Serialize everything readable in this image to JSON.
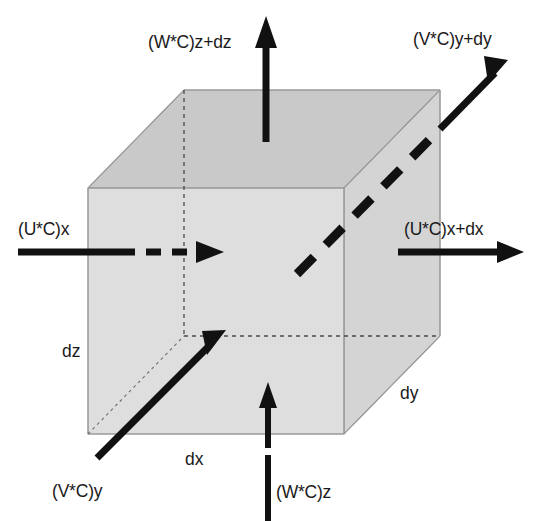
{
  "figure": {
    "background_color": "#ffffff",
    "ink_color": "#111111",
    "cube": {
      "front_face_color": "#dcdcdc",
      "top_face_color": "#c9c9c9",
      "side_face_color": "#d2d2d2",
      "edge_color": "#9a9a9a"
    }
  },
  "labels": {
    "top_flux": "(W*C)z+dz",
    "top_right_flux": "(V*C)y+dy",
    "left_flux": "(U*C)x",
    "right_flux": "(U*C)x+dx",
    "bottom_left_flux": "(V*C)y",
    "bottom_flux": "(W*C)z",
    "dim_dz": "dz",
    "dim_dx": "dx",
    "dim_dy": "dy"
  },
  "arrows": [
    {
      "name": "w-c-z-plus-dz",
      "label": "(W*C)z+dz",
      "direction": "up",
      "style": "solid",
      "axis": "z",
      "face": "top"
    },
    {
      "name": "v-c-y-plus-dy",
      "label": "(V*C)y+dy",
      "direction": "up-right",
      "style": "dashed-to-solid",
      "axis": "y",
      "face": "back-right"
    },
    {
      "name": "u-c-x",
      "label": "(U*C)x",
      "direction": "right",
      "style": "solid-to-dashed",
      "axis": "x",
      "face": "left"
    },
    {
      "name": "u-c-x-plus-dx",
      "label": "(U*C)x+dx",
      "direction": "right",
      "style": "solid",
      "axis": "x",
      "face": "right"
    },
    {
      "name": "v-c-y",
      "label": "(V*C)y",
      "direction": "up-right",
      "style": "solid",
      "axis": "y",
      "face": "front-left"
    },
    {
      "name": "w-c-z",
      "label": "(W*C)z",
      "direction": "up",
      "style": "solid",
      "axis": "z",
      "face": "bottom"
    }
  ],
  "dimensions": [
    {
      "name": "dz",
      "label": "dz",
      "axis": "z"
    },
    {
      "name": "dx",
      "label": "dx",
      "axis": "x"
    },
    {
      "name": "dy",
      "label": "dy",
      "axis": "y"
    }
  ]
}
